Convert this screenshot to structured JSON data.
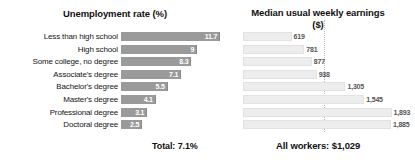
{
  "chart_data": {
    "type": "bar",
    "orientation": "horizontal",
    "grid": false,
    "legend": null,
    "categories": [
      "Less than high school",
      "High school",
      "Some college, no degree",
      "Associate's degree",
      "Bachelor's degree",
      "Master's degree",
      "Professional degree",
      "Doctoral degree"
    ],
    "panels": [
      {
        "id": "unemployment",
        "title": "Unemployment rate (%)",
        "xlabel": "",
        "ylabel": "",
        "xlim": [
          0,
          12.5
        ],
        "values": [
          11.7,
          9.0,
          8.3,
          7.1,
          5.5,
          4.1,
          3.1,
          2.5
        ],
        "value_labels": [
          "11.7",
          "9",
          "8.3",
          "7.1",
          "5.5",
          "4.1",
          "3.1",
          "2.5"
        ],
        "bar_color": "#9a9a9a",
        "label_color": "#ffffff",
        "footer": "Total: 7.1%"
      },
      {
        "id": "earnings",
        "title": "Median usual weekly earnings\n($)",
        "xlabel": "",
        "ylabel": "",
        "xlim": [
          0,
          2000
        ],
        "values": [
          619,
          781,
          877,
          938,
          1305,
          1545,
          1893,
          1885
        ],
        "value_labels": [
          "619",
          "781",
          "877",
          "938",
          "1,305",
          "1,545",
          "1,893",
          "1,885"
        ],
        "bar_color": "#ededed",
        "label_color": "#555555",
        "reference_line": 1029,
        "footer": "All workers:  $1,029"
      }
    ]
  }
}
